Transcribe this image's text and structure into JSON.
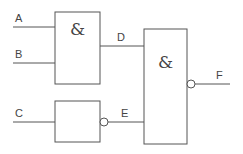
{
  "diagram": {
    "type": "logic-circuit",
    "inputs": [
      {
        "id": "A",
        "label": "A"
      },
      {
        "id": "B",
        "label": "B"
      },
      {
        "id": "C",
        "label": "C"
      }
    ],
    "gates": [
      {
        "id": "gate1",
        "symbol": "&",
        "inputs": [
          "A",
          "B"
        ],
        "output": "D",
        "inverted_output": false
      },
      {
        "id": "gate2",
        "symbol": "",
        "inputs": [
          "C"
        ],
        "output": "E",
        "inverted_output": true
      },
      {
        "id": "gate3",
        "symbol": "&",
        "inputs": [
          "D",
          "E"
        ],
        "output": "F",
        "inverted_output": true
      }
    ],
    "signals": {
      "A": "A",
      "B": "B",
      "C": "C",
      "D": "D",
      "E": "E",
      "F": "F"
    },
    "gate_symbols": {
      "gate1": "&",
      "gate3": "&"
    },
    "colors": {
      "line": "#555555",
      "text": "#444444",
      "background": "#ffffff"
    }
  }
}
